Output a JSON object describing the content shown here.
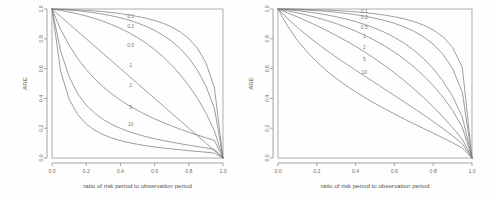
{
  "figure": {
    "background_color": "#fefefe",
    "line_color": "#7d7d7d",
    "axis_color": "#8d8d8d",
    "text_color": "#6e6e6e"
  },
  "chart_data": [
    {
      "type": "line",
      "panel": "left",
      "title": "",
      "xlabel": "ratio of risk period to observation period",
      "ylabel": "ARE",
      "xlim": [
        0,
        1
      ],
      "ylim": [
        0,
        1
      ],
      "grid": false,
      "legend_position": "inline-labels",
      "xticks": [
        "0.0",
        "0.2",
        "0.4",
        "0.6",
        "0.8",
        "1.0"
      ],
      "xtick_values": [
        0.0,
        0.2,
        0.4,
        0.6,
        0.8,
        1.0
      ],
      "yticks": [
        "0.0",
        "0.2",
        "0.4",
        "0.6",
        "0.8",
        "1.0"
      ],
      "ytick_values": [
        0.0,
        0.2,
        0.4,
        0.6,
        0.8,
        1.0
      ],
      "x": [
        0.0,
        0.05,
        0.1,
        0.15,
        0.2,
        0.25,
        0.3,
        0.35,
        0.4,
        0.45,
        0.5,
        0.55,
        0.6,
        0.65,
        0.7,
        0.75,
        0.8,
        0.85,
        0.9,
        0.95,
        1.0
      ],
      "series": [
        {
          "name": "0.1",
          "label": "0.1",
          "label_x": 0.46,
          "label_y": 0.955,
          "values": [
            1.0,
            0.999,
            0.997,
            0.994,
            0.991,
            0.987,
            0.982,
            0.976,
            0.969,
            0.96,
            0.95,
            0.938,
            0.923,
            0.904,
            0.879,
            0.846,
            0.801,
            0.737,
            0.64,
            0.47,
            0.0
          ]
        },
        {
          "name": "0.2",
          "label": "0.2",
          "label_x": 0.46,
          "label_y": 0.887,
          "values": [
            1.0,
            0.997,
            0.993,
            0.988,
            0.982,
            0.974,
            0.965,
            0.954,
            0.941,
            0.925,
            0.906,
            0.884,
            0.857,
            0.824,
            0.784,
            0.734,
            0.671,
            0.59,
            0.484,
            0.333,
            0.0
          ]
        },
        {
          "name": "0.5",
          "label": "0.5",
          "label_x": 0.46,
          "label_y": 0.757,
          "values": [
            1.0,
            0.991,
            0.98,
            0.967,
            0.953,
            0.936,
            0.917,
            0.895,
            0.87,
            0.841,
            0.808,
            0.771,
            0.728,
            0.679,
            0.623,
            0.559,
            0.486,
            0.402,
            0.303,
            0.182,
            0.0
          ]
        },
        {
          "name": "1",
          "label": "1",
          "label_x": 0.46,
          "label_y": 0.625,
          "values": [
            1.0,
            0.95,
            0.9,
            0.85,
            0.8,
            0.75,
            0.7,
            0.65,
            0.6,
            0.55,
            0.5,
            0.45,
            0.4,
            0.35,
            0.3,
            0.25,
            0.2,
            0.15,
            0.1,
            0.05,
            0.0
          ]
        },
        {
          "name": "2",
          "label": "2",
          "label_x": 0.46,
          "label_y": 0.49,
          "values": [
            1.0,
            0.864,
            0.757,
            0.668,
            0.594,
            0.531,
            0.477,
            0.43,
            0.389,
            0.352,
            0.32,
            0.29,
            0.263,
            0.238,
            0.215,
            0.193,
            0.173,
            0.154,
            0.136,
            0.118,
            0.0
          ]
        },
        {
          "name": "5",
          "label": "5",
          "label_x": 0.46,
          "label_y": 0.345,
          "values": [
            1.0,
            0.72,
            0.545,
            0.432,
            0.355,
            0.3,
            0.258,
            0.225,
            0.199,
            0.177,
            0.159,
            0.143,
            0.129,
            0.117,
            0.106,
            0.096,
            0.086,
            0.077,
            0.068,
            0.058,
            0.0
          ]
        },
        {
          "name": "10",
          "label": "10",
          "label_x": 0.46,
          "label_y": 0.225,
          "values": [
            1.0,
            0.585,
            0.395,
            0.292,
            0.228,
            0.186,
            0.156,
            0.134,
            0.117,
            0.103,
            0.092,
            0.082,
            0.074,
            0.067,
            0.061,
            0.055,
            0.049,
            0.044,
            0.039,
            0.033,
            0.0
          ]
        }
      ]
    },
    {
      "type": "line",
      "panel": "right",
      "title": "",
      "xlabel": "ratio of risk period to observation period",
      "ylabel": "ARE",
      "xlim": [
        0,
        1
      ],
      "ylim": [
        0,
        1
      ],
      "grid": false,
      "legend_position": "inline-labels",
      "xticks": [
        "0.0",
        "0.2",
        "0.4",
        "0.6",
        "0.8",
        "1.0"
      ],
      "xtick_values": [
        0.0,
        0.2,
        0.4,
        0.6,
        0.8,
        1.0
      ],
      "yticks": [
        "0.0",
        "0.2",
        "0.4",
        "0.6",
        "0.8",
        "1.0"
      ],
      "ytick_values": [
        0.0,
        0.2,
        0.4,
        0.6,
        0.8,
        1.0
      ],
      "x": [
        0.0,
        0.05,
        0.1,
        0.15,
        0.2,
        0.25,
        0.3,
        0.35,
        0.4,
        0.45,
        0.5,
        0.55,
        0.6,
        0.65,
        0.7,
        0.75,
        0.8,
        0.85,
        0.9,
        0.95,
        1.0
      ],
      "series": [
        {
          "name": "0.1",
          "label": "0.1",
          "label_x": 0.445,
          "label_y": 0.985,
          "values": [
            1.0,
            0.9995,
            0.9985,
            0.997,
            0.995,
            0.993,
            0.99,
            0.986,
            0.981,
            0.975,
            0.968,
            0.959,
            0.948,
            0.934,
            0.916,
            0.892,
            0.86,
            0.814,
            0.742,
            0.609,
            0.0
          ]
        },
        {
          "name": "0.2",
          "label": "0.2",
          "label_x": 0.445,
          "label_y": 0.945,
          "values": [
            1.0,
            0.999,
            0.996,
            0.993,
            0.989,
            0.984,
            0.978,
            0.971,
            0.962,
            0.951,
            0.938,
            0.923,
            0.904,
            0.88,
            0.851,
            0.813,
            0.764,
            0.697,
            0.6,
            0.442,
            0.0
          ]
        },
        {
          "name": "0.5",
          "label": "0.5",
          "label_x": 0.445,
          "label_y": 0.877,
          "values": [
            1.0,
            0.995,
            0.989,
            0.981,
            0.972,
            0.961,
            0.948,
            0.933,
            0.916,
            0.895,
            0.871,
            0.843,
            0.81,
            0.771,
            0.724,
            0.668,
            0.6,
            0.517,
            0.414,
            0.276,
            0.0
          ]
        },
        {
          "name": "1",
          "label": "1",
          "label_x": 0.445,
          "label_y": 0.817,
          "values": [
            1.0,
            0.988,
            0.974,
            0.959,
            0.942,
            0.923,
            0.902,
            0.878,
            0.852,
            0.822,
            0.789,
            0.752,
            0.711,
            0.664,
            0.612,
            0.553,
            0.486,
            0.409,
            0.319,
            0.207,
            0.0
          ]
        },
        {
          "name": "2",
          "label": "2",
          "label_x": 0.445,
          "label_y": 0.742,
          "values": [
            1.0,
            0.974,
            0.947,
            0.918,
            0.888,
            0.856,
            0.822,
            0.787,
            0.749,
            0.709,
            0.666,
            0.62,
            0.572,
            0.52,
            0.465,
            0.406,
            0.343,
            0.276,
            0.204,
            0.126,
            0.0
          ]
        },
        {
          "name": "5",
          "label": "5",
          "label_x": 0.445,
          "label_y": 0.662,
          "values": [
            1.0,
            0.935,
            0.876,
            0.822,
            0.771,
            0.723,
            0.677,
            0.633,
            0.59,
            0.547,
            0.505,
            0.462,
            0.42,
            0.377,
            0.334,
            0.29,
            0.245,
            0.198,
            0.149,
            0.095,
            0.0
          ]
        },
        {
          "name": "10",
          "label": "10",
          "label_x": 0.445,
          "label_y": 0.578,
          "values": [
            1.0,
            0.884,
            0.79,
            0.712,
            0.645,
            0.586,
            0.534,
            0.487,
            0.444,
            0.404,
            0.366,
            0.33,
            0.296,
            0.262,
            0.23,
            0.198,
            0.167,
            0.135,
            0.102,
            0.067,
            0.0
          ]
        }
      ]
    }
  ]
}
